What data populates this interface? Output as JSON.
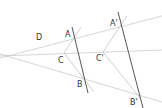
{
  "diagram": {
    "type": "geometric-homothety",
    "colors": {
      "thin_line": "#bdbdbd",
      "thick_line": "#555555",
      "label": "#333333"
    },
    "center": {
      "x": 10,
      "y": 56
    },
    "labels": {
      "D": "D",
      "A": "A",
      "B": "B",
      "C": "C",
      "A_prime": "A'",
      "B_prime": "B'",
      "C_prime": "C'"
    },
    "points": {
      "A": [
        74,
        38
      ],
      "B": [
        84,
        80
      ],
      "C": [
        65,
        53
      ],
      "A_prime": [
        121,
        26
      ],
      "B_prime": [
        140,
        98
      ],
      "C_prime": [
        104,
        52
      ]
    }
  }
}
